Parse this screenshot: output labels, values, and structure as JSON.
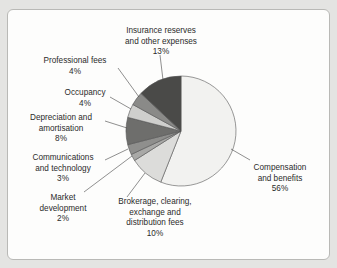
{
  "chart_data": {
    "type": "pie",
    "title": "",
    "start_angle_deg": 0,
    "direction": "clockwise",
    "slices": [
      {
        "label": "Compensation and benefits",
        "value": 56,
        "color": "#f2f2f0"
      },
      {
        "label": "Brokerage, clearing, exchange and distribution fees",
        "value": 10,
        "color": "#dcdcda"
      },
      {
        "label": "Market development",
        "value": 2,
        "color": "#a9a9a7"
      },
      {
        "label": "Communications and technology",
        "value": 3,
        "color": "#8f8f8d"
      },
      {
        "label": "Depreciation and amortisation",
        "value": 8,
        "color": "#6e6e6c"
      },
      {
        "label": "Occupancy",
        "value": 4,
        "color": "#cfcfcd"
      },
      {
        "label": "Professional fees",
        "value": 4,
        "color": "#8a8a88"
      },
      {
        "label": "Insurance reserves and other expenses",
        "value": 13,
        "color": "#4a4a48"
      }
    ]
  },
  "labels": {
    "insurance": {
      "l1": "Insurance reserves",
      "l2": "and other expenses",
      "pct": "13%"
    },
    "professional": {
      "l1": "Professional fees",
      "pct": "4%"
    },
    "occupancy": {
      "l1": "Occupancy",
      "pct": "4%"
    },
    "depreciation": {
      "l1": "Depreciation and",
      "l2": "amortisation",
      "pct": "8%"
    },
    "communications": {
      "l1": "Communications",
      "l2": "and technology",
      "pct": "3%"
    },
    "market": {
      "l1": "Market",
      "l2": "development",
      "pct": "2%"
    },
    "brokerage": {
      "l1": "Brokerage, clearing,",
      "l2": "exchange and",
      "l3": "distribution fees",
      "pct": "10%"
    },
    "compensation": {
      "l1": "Compensation",
      "l2": "and benefits",
      "pct": "56%"
    }
  }
}
